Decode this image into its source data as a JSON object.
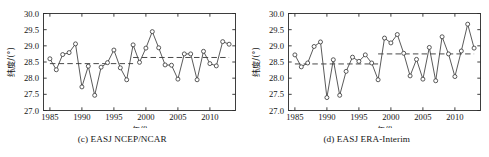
{
  "page": {
    "background": "#ffffff",
    "width": 489,
    "height": 157
  },
  "panels": [
    {
      "id": "panel-c",
      "caption": "(c) EASJ NCEP/NCAR"
    },
    {
      "id": "panel-d",
      "caption": "(d) EASJ ERA-Interim"
    }
  ],
  "axis_labels": {
    "y": "纬度/(°)",
    "x": "年份"
  },
  "y_ticks": [
    "27.0",
    "27.5",
    "28.0",
    "28.5",
    "29.0",
    "29.5",
    "30.0"
  ],
  "x_ticks": [
    "1985",
    "1990",
    "1995",
    "2000",
    "2005",
    "2010"
  ],
  "style": {
    "line_color": "#3c3c3c",
    "marker_fill": "#ffffff",
    "marker_stroke": "#3c3c3c",
    "mean_line_color": "#4a4a4a",
    "frame_color": "#2b2b2b"
  },
  "chart_data": [
    {
      "type": "line",
      "title": "(c) EASJ NCEP/NCAR",
      "xlabel": "年份",
      "ylabel": "纬度/(°)",
      "xlim": [
        1984,
        2014
      ],
      "ylim": [
        27.0,
        30.0
      ],
      "grid": false,
      "legend": "none",
      "markers": "open-circle",
      "x": [
        1985,
        1986,
        1987,
        1988,
        1989,
        1990,
        1991,
        1992,
        1993,
        1994,
        1995,
        1996,
        1997,
        1998,
        1999,
        2000,
        2001,
        2002,
        2003,
        2004,
        2005,
        2006,
        2007,
        2008,
        2009,
        2010,
        2011,
        2012,
        2013
      ],
      "y": [
        28.6,
        28.26,
        28.73,
        28.79,
        29.06,
        27.73,
        28.37,
        27.47,
        28.34,
        28.48,
        28.87,
        28.32,
        27.95,
        29.03,
        28.49,
        28.93,
        29.44,
        28.94,
        28.41,
        28.4,
        27.97,
        28.75,
        28.75,
        27.95,
        28.83,
        28.45,
        28.38,
        29.13,
        29.05
      ],
      "annotations": [
        {
          "type": "mean-segment",
          "label": "pre-shift mean",
          "x_start": 1985,
          "x_end": 1998,
          "value": 28.45,
          "style": "dashed"
        },
        {
          "type": "mean-segment",
          "label": "post-shift mean",
          "x_start": 1998,
          "x_end": 2013,
          "value": 28.64,
          "style": "dashed"
        }
      ]
    },
    {
      "type": "line",
      "title": "(d) EASJ ERA-Interim",
      "xlabel": "年份",
      "ylabel": "纬度/(°)",
      "xlim": [
        1984,
        2014
      ],
      "ylim": [
        27.0,
        30.0
      ],
      "grid": false,
      "legend": "none",
      "markers": "open-circle",
      "x": [
        1985,
        1986,
        1987,
        1988,
        1989,
        1990,
        1991,
        1992,
        1993,
        1994,
        1995,
        1996,
        1997,
        1998,
        1999,
        2000,
        2001,
        2002,
        2003,
        2004,
        2005,
        2006,
        2007,
        2008,
        2009,
        2010,
        2011,
        2012,
        2013
      ],
      "y": [
        28.72,
        28.35,
        28.47,
        28.98,
        29.12,
        27.4,
        28.57,
        27.47,
        28.21,
        28.65,
        28.52,
        28.72,
        28.47,
        27.95,
        29.24,
        29.09,
        29.35,
        28.77,
        28.07,
        28.58,
        27.97,
        28.95,
        27.92,
        29.28,
        28.75,
        28.05,
        28.84,
        29.67,
        28.93
      ],
      "annotations": [
        {
          "type": "mean-segment",
          "label": "pre-shift mean",
          "x_start": 1985,
          "x_end": 1998,
          "value": 28.44,
          "style": "dashed"
        },
        {
          "type": "mean-segment",
          "label": "post-shift mean",
          "x_start": 1998,
          "x_end": 2013,
          "value": 28.75,
          "style": "dashed"
        }
      ]
    }
  ]
}
